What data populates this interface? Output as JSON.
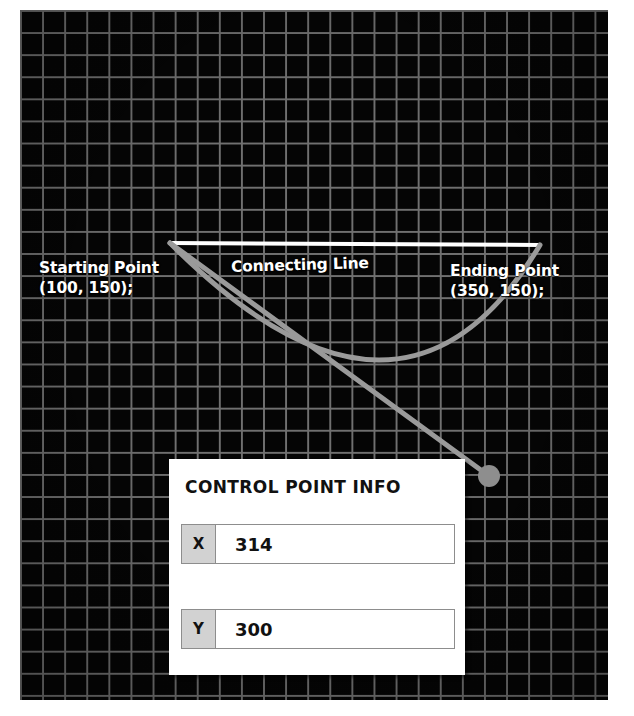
{
  "canvas": {
    "background_color": "#050505",
    "grid_line_color": "#707070",
    "grid_cell_px": 22
  },
  "annotations": {
    "start_point": {
      "title": "Starting Point",
      "coords": "(100, 150);",
      "text": "Starting Point\n(100, 150);"
    },
    "connecting_line": {
      "text": "Connecting Line"
    },
    "end_point": {
      "title": "Ending Point",
      "coords": "(350, 150);",
      "text": "Ending Point\n(350, 150);"
    }
  },
  "graphics": {
    "connecting_line_color": "#ffffff",
    "curve_color": "#9a9a9a",
    "handle_color": "#9a9a9a",
    "control_handle_label": "control-point-handle",
    "start_anchor": {
      "x": 170,
      "y": 243
    },
    "end_anchor": {
      "x": 540,
      "y": 245
    },
    "control_handle": {
      "x": 489,
      "y": 476
    },
    "curve_low_point": {
      "x": 400,
      "y": 357
    }
  },
  "panel": {
    "title": "CONTROL POINT INFO",
    "fields": [
      {
        "key": "X",
        "value": "314"
      },
      {
        "key": "Y",
        "value": "300"
      }
    ]
  }
}
